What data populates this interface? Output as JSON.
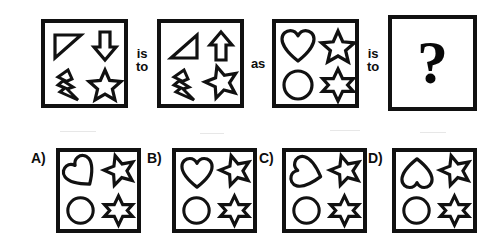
{
  "puzzle": {
    "type": "visual-analogy-matrix",
    "question_mark": "?",
    "connectors": [
      {
        "id": "conn-1",
        "line1": "is",
        "line2": "to"
      },
      {
        "id": "conn-2",
        "line1": "as",
        "line2": ""
      },
      {
        "id": "conn-3",
        "line1": "is",
        "line2": "to"
      }
    ],
    "prompt_row": [
      {
        "id": "panel-1",
        "name": "panel-a-source",
        "shapes": [
          {
            "slot": "top-left",
            "icon": "right-triangle",
            "rotation": 0,
            "variant": "outline"
          },
          {
            "slot": "top-right",
            "icon": "down-arrow",
            "rotation": 0,
            "variant": "outline"
          },
          {
            "slot": "bottom-left",
            "icon": "lightning-bolt",
            "rotation": 0,
            "variant": "outline"
          },
          {
            "slot": "bottom-right",
            "icon": "five-point-star",
            "rotation": 0,
            "variant": "outline"
          }
        ]
      },
      {
        "id": "panel-2",
        "name": "panel-b-transformed",
        "shapes": [
          {
            "slot": "top-left",
            "icon": "right-triangle",
            "rotation": 180,
            "variant": "outline"
          },
          {
            "slot": "top-right",
            "icon": "up-arrow",
            "rotation": 0,
            "variant": "outline"
          },
          {
            "slot": "bottom-left",
            "icon": "lightning-bolt",
            "rotation": 0,
            "variant": "outline"
          },
          {
            "slot": "bottom-right",
            "icon": "five-point-star",
            "rotation": 200,
            "variant": "outline"
          }
        ]
      },
      {
        "id": "panel-3",
        "name": "panel-c-source",
        "shapes": [
          {
            "slot": "top-left",
            "icon": "heart",
            "rotation": 0,
            "variant": "outline"
          },
          {
            "slot": "top-right",
            "icon": "five-point-star",
            "rotation": 0,
            "variant": "outline"
          },
          {
            "slot": "bottom-left",
            "icon": "circle",
            "rotation": 0,
            "variant": "outline"
          },
          {
            "slot": "bottom-right",
            "icon": "six-point-star",
            "rotation": 0,
            "variant": "outline"
          }
        ]
      },
      {
        "id": "panel-4",
        "name": "panel-d-answer-slot",
        "shapes": [],
        "content": "question-mark"
      }
    ],
    "options": [
      {
        "id": "option-a",
        "label": "A)",
        "shapes": [
          {
            "slot": "top-left",
            "icon": "heart",
            "rotation": -38,
            "variant": "outline"
          },
          {
            "slot": "top-right",
            "icon": "five-point-star",
            "rotation": 200,
            "variant": "outline"
          },
          {
            "slot": "bottom-left",
            "icon": "circle",
            "rotation": 0,
            "variant": "outline"
          },
          {
            "slot": "bottom-right",
            "icon": "six-point-star",
            "rotation": 0,
            "variant": "outline"
          }
        ]
      },
      {
        "id": "option-b",
        "label": "B)",
        "shapes": [
          {
            "slot": "top-left",
            "icon": "heart",
            "rotation": 0,
            "variant": "outline"
          },
          {
            "slot": "top-right",
            "icon": "five-point-star",
            "rotation": 200,
            "variant": "outline"
          },
          {
            "slot": "bottom-left",
            "icon": "circle",
            "rotation": 0,
            "variant": "outline"
          },
          {
            "slot": "bottom-right",
            "icon": "six-point-star",
            "rotation": 0,
            "variant": "outline"
          }
        ]
      },
      {
        "id": "option-c",
        "label": "C)",
        "shapes": [
          {
            "slot": "top-left",
            "icon": "heart",
            "rotation": -75,
            "variant": "outline"
          },
          {
            "slot": "top-right",
            "icon": "five-point-star",
            "rotation": 200,
            "variant": "outline"
          },
          {
            "slot": "bottom-left",
            "icon": "circle",
            "rotation": 0,
            "variant": "outline"
          },
          {
            "slot": "bottom-right",
            "icon": "six-point-star",
            "rotation": 0,
            "variant": "outline"
          }
        ]
      },
      {
        "id": "option-d",
        "label": "D)",
        "shapes": [
          {
            "slot": "top-left",
            "icon": "heart",
            "rotation": 180,
            "variant": "outline"
          },
          {
            "slot": "top-right",
            "icon": "five-point-star",
            "rotation": 200,
            "variant": "outline"
          },
          {
            "slot": "bottom-left",
            "icon": "circle",
            "rotation": 0,
            "variant": "outline"
          },
          {
            "slot": "bottom-right",
            "icon": "six-point-star",
            "rotation": 0,
            "variant": "outline"
          }
        ]
      }
    ]
  },
  "colors": {
    "ink": "#111111",
    "paper": "#ffffff"
  }
}
